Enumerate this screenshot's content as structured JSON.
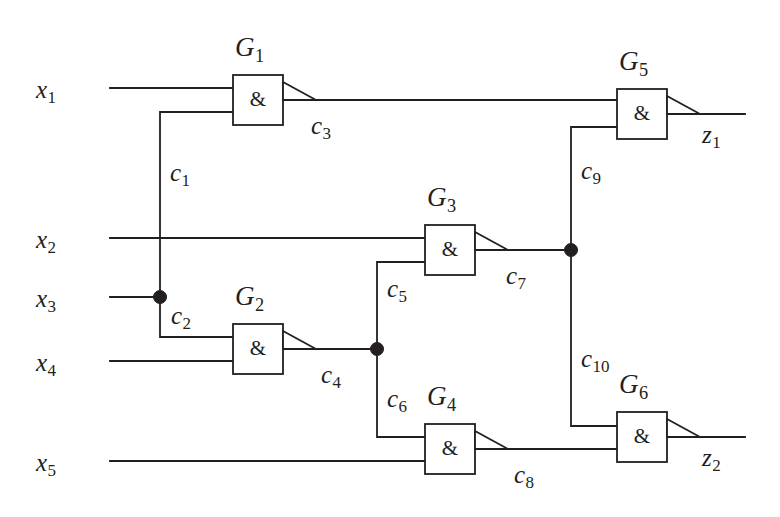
{
  "diagram": {
    "type": "logic-circuit-schematic",
    "line_color": "#231f20",
    "background_color": "#ffffff",
    "gate_symbol": "&",
    "gate_kind": "NAND",
    "inputs": [
      {
        "id": "x1",
        "base": "x",
        "sub": "1"
      },
      {
        "id": "x2",
        "base": "x",
        "sub": "2"
      },
      {
        "id": "x3",
        "base": "x",
        "sub": "3"
      },
      {
        "id": "x4",
        "base": "x",
        "sub": "4"
      },
      {
        "id": "x5",
        "base": "x",
        "sub": "5"
      }
    ],
    "outputs": [
      {
        "id": "z1",
        "base": "z",
        "sub": "1"
      },
      {
        "id": "z2",
        "base": "z",
        "sub": "2"
      }
    ],
    "gates": [
      {
        "id": "G1",
        "base": "G",
        "sub": "1",
        "symbol": "&",
        "inputs": [
          "x1",
          "c1"
        ],
        "output": "c3"
      },
      {
        "id": "G2",
        "base": "G",
        "sub": "2",
        "symbol": "&",
        "inputs": [
          "c2",
          "x4"
        ],
        "output": "c4"
      },
      {
        "id": "G3",
        "base": "G",
        "sub": "3",
        "symbol": "&",
        "inputs": [
          "x2",
          "c5"
        ],
        "output": "c7"
      },
      {
        "id": "G4",
        "base": "G",
        "sub": "4",
        "symbol": "&",
        "inputs": [
          "c6",
          "x5"
        ],
        "output": "c8"
      },
      {
        "id": "G5",
        "base": "G",
        "sub": "5",
        "symbol": "&",
        "inputs": [
          "c3",
          "c9"
        ],
        "output": "z1"
      },
      {
        "id": "G6",
        "base": "G",
        "sub": "6",
        "symbol": "&",
        "inputs": [
          "c10",
          "c8"
        ],
        "output": "z2"
      }
    ],
    "nets": [
      {
        "id": "c1",
        "base": "c",
        "sub": "1",
        "from": "x3",
        "to": "G1"
      },
      {
        "id": "c2",
        "base": "c",
        "sub": "2",
        "from": "x3",
        "to": "G2"
      },
      {
        "id": "c3",
        "base": "c",
        "sub": "3",
        "from": "G1",
        "to": "G5"
      },
      {
        "id": "c4",
        "base": "c",
        "sub": "4",
        "from": "G2",
        "to": "fanout-c4"
      },
      {
        "id": "c5",
        "base": "c",
        "sub": "5",
        "from": "fanout-c4",
        "to": "G3"
      },
      {
        "id": "c6",
        "base": "c",
        "sub": "6",
        "from": "fanout-c4",
        "to": "G4"
      },
      {
        "id": "c7",
        "base": "c",
        "sub": "7",
        "from": "G3",
        "to": "fanout-c7"
      },
      {
        "id": "c8",
        "base": "c",
        "sub": "8",
        "from": "G4",
        "to": "G6"
      },
      {
        "id": "c9",
        "base": "c",
        "sub": "9",
        "from": "fanout-c7",
        "to": "G5"
      },
      {
        "id": "c10",
        "base": "c",
        "sub": "10",
        "from": "fanout-c7",
        "to": "G6"
      }
    ],
    "junctions": [
      {
        "id": "fanout-x3",
        "x": 160,
        "y": 297
      },
      {
        "id": "fanout-c4",
        "x": 377,
        "y": 348
      },
      {
        "id": "fanout-c7",
        "x": 571,
        "y": 250
      }
    ]
  }
}
